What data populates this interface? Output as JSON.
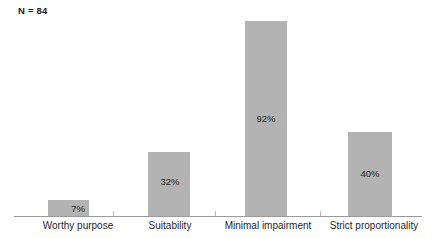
{
  "chart_data": {
    "type": "bar",
    "title": "",
    "subtitle": "",
    "xlabel": "",
    "ylabel": "",
    "ylim": [
      0,
      100
    ],
    "grid": false,
    "legend": false,
    "annotations": {
      "sample_size": "N = 84"
    },
    "categories": [
      "Worthy purpose",
      "Suitability",
      "Minimal impairment",
      "Strict proportionality"
    ],
    "values": [
      7,
      32,
      92,
      40
    ],
    "value_labels": [
      "7%",
      "32%",
      "92%",
      "40%"
    ],
    "bar_color": "#b3b3b3",
    "axis_color": "#9a9a9a",
    "text_color": "#1f1f1f"
  },
  "bars": [
    {
      "category": "Worthy purpose",
      "value_label": "7%",
      "left": 48,
      "width": 41,
      "top": 200,
      "height": 16,
      "label_top": 203,
      "label_left": 18,
      "label_width": 120
    },
    {
      "category": "Suitability",
      "value_label": "32%",
      "left": 148,
      "width": 42,
      "top": 152,
      "height": 64,
      "label_top": 176,
      "label_left": 110,
      "label_width": 120
    },
    {
      "category": "Minimal impairment",
      "value_label": "92%",
      "left": 245,
      "width": 42,
      "top": 21,
      "height": 195,
      "label_top": 113,
      "label_left": 206,
      "label_width": 120
    },
    {
      "category": "Strict proportionality",
      "value_label": "40%",
      "left": 348,
      "width": 44,
      "top": 132,
      "height": 84,
      "label_top": 168,
      "label_left": 310,
      "label_width": 120
    }
  ],
  "ticks": [
    113,
    215,
    320
  ],
  "labels": [
    {
      "text": "Worthy purpose",
      "left": 18,
      "width": 120
    },
    {
      "text": "Suitability",
      "left": 110,
      "width": 120
    },
    {
      "text": "Minimal impairment",
      "left": 206,
      "width": 124
    },
    {
      "text": "Strict proportionality",
      "left": 312,
      "width": 124
    }
  ]
}
